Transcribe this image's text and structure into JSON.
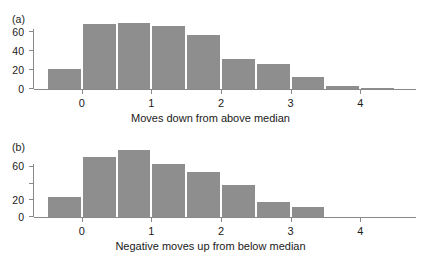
{
  "figure": {
    "width": 421,
    "height": 257,
    "background": "#ffffff",
    "bar_color": "#8e8e8e",
    "axis_color": "#8a8a8a",
    "text_color": "#1a1a1a"
  },
  "panels": [
    {
      "tag": "(a)",
      "xlabel": "Moves down from above median",
      "ytick_labels": [
        "0",
        "20",
        "40",
        "60"
      ],
      "xtick_labels": [
        "0",
        "1",
        "2",
        "3",
        "4"
      ]
    },
    {
      "tag": "(b)",
      "xlabel": "Negative moves up from below median",
      "ytick_labels": [
        "0",
        "20",
        "",
        "60"
      ],
      "xtick_labels": [
        "0",
        "1",
        "2",
        "3",
        "4"
      ]
    }
  ],
  "chart_data": [
    {
      "type": "bar",
      "title": "",
      "panel": "(a)",
      "xlabel": "Moves down from above median",
      "ylabel": "",
      "bin_width": 0.5,
      "bin_starts": [
        -0.5,
        0.0,
        0.5,
        1.0,
        1.5,
        2.0,
        2.5,
        3.0,
        3.5,
        4.0
      ],
      "bin_centers": [
        -0.25,
        0.25,
        0.75,
        1.25,
        1.75,
        2.25,
        2.75,
        3.25,
        3.75,
        4.25
      ],
      "categories": [
        "-0.5 to 0",
        "0 to 0.5",
        "0.5 to 1",
        "1 to 1.5",
        "1.5 to 2",
        "2 to 2.5",
        "2.5 to 3",
        "3 to 3.5",
        "3.5 to 4",
        "4 to 4.5"
      ],
      "values": [
        21,
        69,
        70,
        67,
        57,
        32,
        26,
        13,
        3,
        1
      ],
      "xlim": [
        -0.6,
        4.6
      ],
      "ylim": [
        0,
        75
      ],
      "yticks": [
        0,
        20,
        40,
        60
      ],
      "ytick_labels": [
        "0",
        "20",
        "40",
        "60"
      ],
      "xticks": [
        0,
        1,
        2,
        3,
        4
      ],
      "xtick_labels": [
        "0",
        "1",
        "2",
        "3",
        "4"
      ],
      "grid": false,
      "legend": false
    },
    {
      "type": "bar",
      "title": "",
      "panel": "(b)",
      "xlabel": "Negative moves up from below median",
      "ylabel": "",
      "bin_width": 0.5,
      "bin_starts": [
        -0.5,
        0.0,
        0.5,
        1.0,
        1.5,
        2.0,
        2.5,
        3.0,
        3.5,
        4.0
      ],
      "bin_centers": [
        -0.25,
        0.25,
        0.75,
        1.25,
        1.75,
        2.25,
        2.75,
        3.25,
        3.75,
        4.25
      ],
      "categories": [
        "-0.5 to 0",
        "0 to 0.5",
        "0.5 to 1",
        "1 to 1.5",
        "1.5 to 2",
        "2 to 2.5",
        "2.5 to 3",
        "3 to 3.5",
        "3.5 to 4",
        "4 to 4.5"
      ],
      "values": [
        24,
        72,
        80,
        64,
        54,
        38,
        18,
        12,
        0,
        0
      ],
      "xlim": [
        -0.6,
        4.6
      ],
      "ylim": [
        0,
        85
      ],
      "yticks": [
        0,
        20,
        40,
        60
      ],
      "ytick_labels": [
        "0",
        "20",
        "",
        "60"
      ],
      "xticks": [
        0,
        1,
        2,
        3,
        4
      ],
      "xtick_labels": [
        "0",
        "1",
        "2",
        "3",
        "4"
      ],
      "grid": false,
      "legend": false
    }
  ]
}
